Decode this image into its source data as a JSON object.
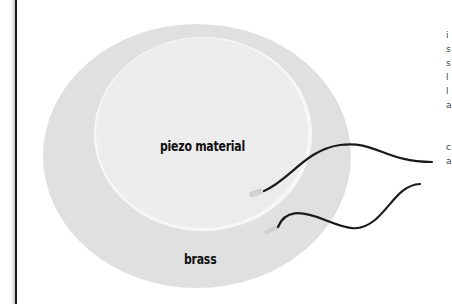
{
  "diagram": {
    "labels": {
      "inner": "piezo material",
      "outer": "brass"
    },
    "components": [
      {
        "name": "brass disc",
        "shape": "circle",
        "color": "#e0e0e0"
      },
      {
        "name": "piezo material disc",
        "shape": "circle",
        "color": "#efefef"
      },
      {
        "name": "wire 1",
        "color": "#1a1a1a",
        "attached_to": "piezo material"
      },
      {
        "name": "wire 2",
        "color": "#1a1a1a",
        "attached_to": "brass"
      }
    ],
    "colors": {
      "background": "#ffffff",
      "brass": "#e0e0e0",
      "piezo": "#efefef",
      "wire": "#1a1a1a",
      "left_rule": "#1a1a1a"
    },
    "cropped_right_text_fragments": [
      "",
      "i",
      "s",
      "s",
      "l",
      "l",
      "a",
      "",
      "",
      "c",
      "a"
    ]
  }
}
